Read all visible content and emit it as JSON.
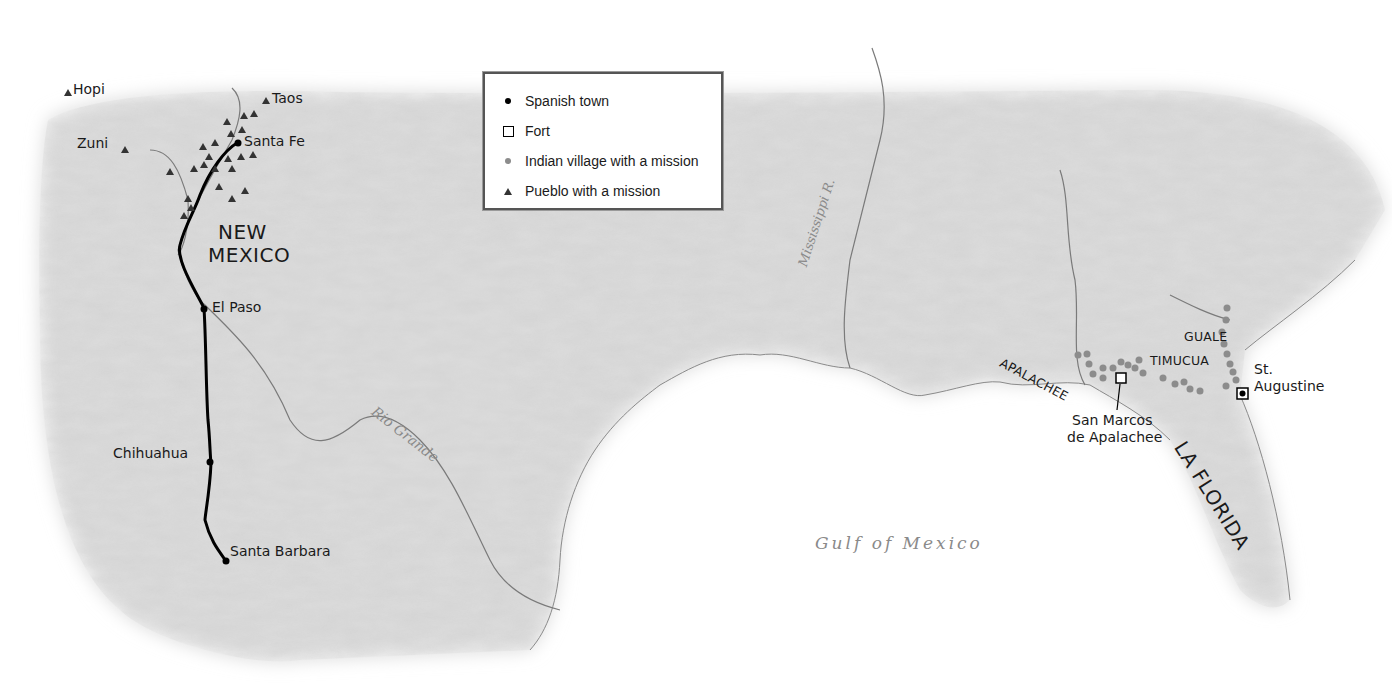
{
  "map": {
    "legend": {
      "items": [
        {
          "symbol": "black-dot",
          "label": "Spanish town"
        },
        {
          "symbol": "open-square",
          "label": "Fort"
        },
        {
          "symbol": "grey-dot",
          "label": "Indian village with a mission"
        },
        {
          "symbol": "black-triangle",
          "label": "Pueblo with a mission"
        }
      ]
    },
    "regions": {
      "new_mexico_line1": "NEW",
      "new_mexico_line2": "MEXICO",
      "la_florida": "LA FLORIDA"
    },
    "tribes": {
      "apalachee": "APALACHEE",
      "guale": "GUALE",
      "timucua": "TIMUCUA"
    },
    "pueblos": {
      "hopi": "Hopi",
      "zuni": "Zuni",
      "taos": "Taos"
    },
    "towns": {
      "santa_fe": "Santa Fe",
      "el_paso": "El Paso",
      "chihuahua": "Chihuahua",
      "santa_barbara": "Santa Barbara",
      "st_augustine_line1": "St.",
      "st_augustine_line2": "Augustine"
    },
    "forts": {
      "san_marcos_line1": "San Marcos",
      "san_marcos_line2": "de Apalachee"
    },
    "water": {
      "rio_grande": "Rio Grande",
      "mississippi": "Mississippi R.",
      "gulf": "Gulf of Mexico"
    },
    "colors": {
      "land": "#dcdcdc",
      "sea": "#ffffff",
      "river": "#7a7a7a",
      "route": "#000000",
      "mission_village": "#8c8c8c",
      "pueblo": "#333333"
    }
  }
}
